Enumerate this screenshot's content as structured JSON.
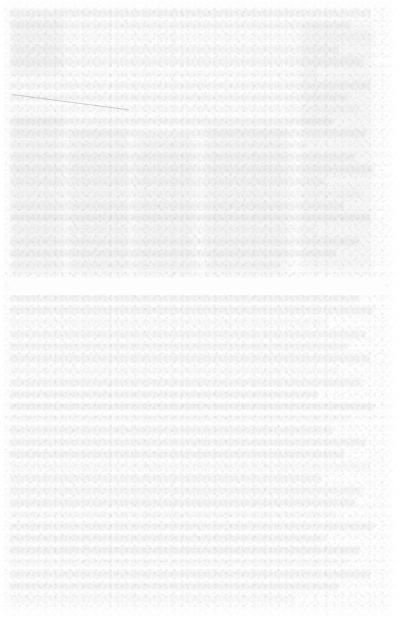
{
  "document": {
    "kind": "faded-scanned-page",
    "legibility": "illegible",
    "legibility_note": "No text is resolvable at any zoom level; ink has bleached to mottled gray noise.",
    "page_width": 405,
    "page_height": 628,
    "paper_color": "#fdfdfd",
    "ink_residue_color": "#7a7a82",
    "margins": {
      "top": 8,
      "left": 10,
      "right": 20,
      "bottom": 22
    }
  },
  "regions": [
    {
      "id": "upper-block",
      "label": "Upper content region",
      "top": 2,
      "height": 270,
      "line_count": 22,
      "tone": "mottled",
      "legible_text": null
    },
    {
      "id": "section-break",
      "label": "Horizontal white section break",
      "top": 270,
      "height": 17,
      "tone": "blank",
      "legible_text": null
    },
    {
      "id": "lower-block",
      "label": "Lower content region",
      "top": 287,
      "height": 310,
      "line_count": 26,
      "tone": "mottled",
      "legible_text": null
    }
  ],
  "structures": {
    "diagonal_rule": {
      "label": "Faint diagonal rule",
      "left": 2,
      "top": 86,
      "length": 118,
      "angle_deg": 7.5,
      "color": "#6e6e76"
    },
    "column_edges_x": [
      52,
      68,
      120,
      152,
      190,
      370
    ],
    "ghost_blocks": [
      {
        "label": "left narrow block",
        "left": 2,
        "top": 8,
        "width": 50,
        "height": 58
      },
      {
        "label": "left column block",
        "left": 2,
        "top": 108,
        "width": 50,
        "height": 160
      },
      {
        "label": "second column block",
        "left": 60,
        "top": 120,
        "width": 58,
        "height": 148
      },
      {
        "label": "mid column block",
        "left": 126,
        "top": 126,
        "width": 58,
        "height": 142
      },
      {
        "label": "right column block",
        "left": 196,
        "top": 118,
        "width": 82,
        "height": 150
      },
      {
        "label": "far right block",
        "left": 292,
        "top": 14,
        "width": 70,
        "height": 250
      }
    ]
  }
}
